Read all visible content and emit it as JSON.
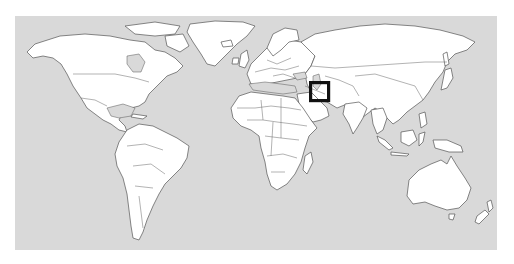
{
  "map": {
    "type": "world-locator-map",
    "projection": "miller-cylindrical",
    "colors": {
      "ocean": "#d9d9d9",
      "land": "#ffffff",
      "borders": "#555555",
      "locator_box": "#111111",
      "page_background": "#ffffff"
    },
    "highlight": {
      "label": "Iran",
      "shape": "square-box",
      "box_px": {
        "x": 309,
        "y": 81,
        "width": 21,
        "height": 21
      }
    },
    "continents": [
      "North America",
      "South America",
      "Europe",
      "Africa",
      "Asia",
      "Australia",
      "Greenland"
    ]
  }
}
